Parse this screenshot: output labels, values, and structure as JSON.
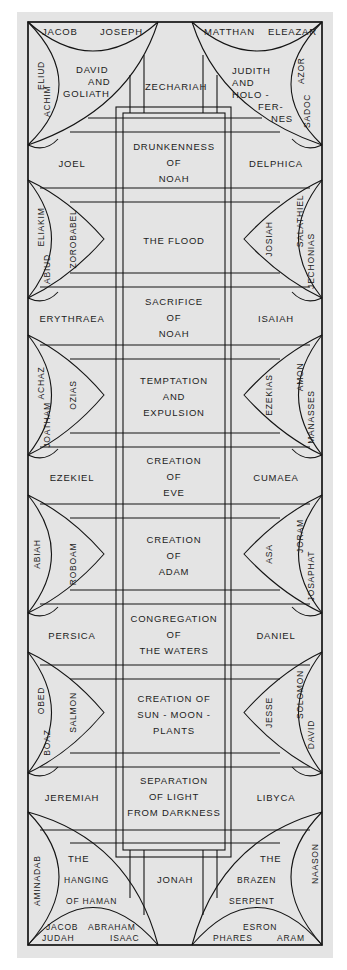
{
  "colors": {
    "panel": "#e4e4e4",
    "ink": "#141414",
    "background": "#ffffff"
  },
  "top": {
    "left_spandrel": {
      "scene": [
        "DAVID",
        "AND",
        "GOLIATH"
      ],
      "ancestors_top": [
        "JACOB",
        "JOSEPH"
      ],
      "ancestors_side": [
        "ELIUD",
        "ACHIM"
      ]
    },
    "center": "ZECHARIAH",
    "right_spandrel": {
      "scene": [
        "JUDITH",
        "AND",
        "HOLO -",
        "FER-",
        "NES"
      ],
      "ancestors_top": [
        "MATTHAN",
        "ELEAZAR"
      ],
      "ancestors_side": [
        "AZOR",
        "SADOC"
      ]
    }
  },
  "bays": [
    {
      "left": "JOEL",
      "center": [
        "DRUNKENNESS",
        "OF",
        "NOAH"
      ],
      "right": "DELPHICA"
    },
    {
      "left_lune": [
        "ELIAKIM",
        "ABIUD",
        "ZOROBABEL"
      ],
      "center": [
        "THE FLOOD"
      ],
      "right_lune": [
        "JOSIAH",
        "SALATHIEL",
        "JECHONIAS"
      ]
    },
    {
      "left": "ERYTHRAEA",
      "center": [
        "SACRIFICE",
        "OF",
        "NOAH"
      ],
      "right": "ISAIAH"
    },
    {
      "left_lune": [
        "ACHAZ",
        "JOATHAM",
        "OZIAS"
      ],
      "center": [
        "TEMPTATION",
        "AND",
        "EXPULSION"
      ],
      "right_lune": [
        "EZEKIAS",
        "AMON",
        "MANASSES"
      ]
    },
    {
      "left": "EZEKIEL",
      "center": [
        "CREATION",
        "OF",
        "EVE"
      ],
      "right": "CUMAEA"
    },
    {
      "left_lune": [
        "ABIAH",
        "ROBOAM"
      ],
      "center": [
        "CREATION",
        "OF",
        "ADAM"
      ],
      "right_lune": [
        "ASA",
        "JORAM",
        "JOSAPHAT"
      ]
    },
    {
      "left": "PERSICA",
      "center": [
        "CONGREGATION",
        "OF",
        "THE WATERS"
      ],
      "right": "DANIEL"
    },
    {
      "left_lune": [
        "OBED",
        "BOAZ",
        "SALMON"
      ],
      "center": [
        "CREATION OF",
        "SUN - MOON -",
        "PLANTS"
      ],
      "right_lune": [
        "JESSE",
        "SOLOMON",
        "DAVID"
      ]
    },
    {
      "left": "JEREMIAH",
      "center": [
        "SEPARATION",
        "OF LIGHT",
        "FROM DARKNESS"
      ],
      "right": "LIBYCA"
    }
  ],
  "bottom": {
    "left_spandrel": {
      "scene": [
        "THE",
        "HANGING",
        "OF HAMAN"
      ],
      "ancestors_side": [
        "AMINADAB"
      ],
      "ancestors_bottom": [
        "JACOB",
        "ABRAHAM",
        "JUDAH",
        "ISAAC"
      ]
    },
    "center": "JONAH",
    "right_spandrel": {
      "scene": [
        "THE",
        "BRAZEN",
        "SERPENT"
      ],
      "ancestors_side": [
        "NAASON"
      ],
      "ancestors_bottom": [
        "ESRON",
        "PHARES",
        "ARAM"
      ]
    }
  }
}
